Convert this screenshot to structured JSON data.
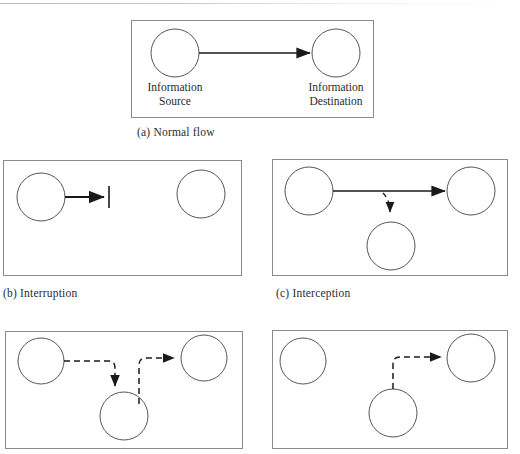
{
  "figure": {
    "stroke_color": "#1a1a1a",
    "box_color": "#8a8a8a",
    "text_color": "#2b2b2b"
  },
  "panels": [
    {
      "id": "a",
      "caption": "(a) Normal flow",
      "labels": {
        "source_line1": "Information",
        "source_line2": "Source",
        "destination_line1": "Information",
        "destination_line2": "Destination"
      },
      "nodes": [
        {
          "name": "information-source",
          "cx": 43,
          "cy": 32,
          "r": 24
        },
        {
          "name": "information-destination",
          "cx": 204,
          "cy": 32,
          "r": 24
        }
      ],
      "flows": [
        {
          "name": "normal-flow-arrow",
          "style": "solid",
          "from": [
            67,
            32
          ],
          "to": [
            178,
            32
          ]
        }
      ]
    },
    {
      "id": "b",
      "caption": "(b) Interruption",
      "nodes": [
        {
          "name": "information-source",
          "cx": 37,
          "cy": 36,
          "r": 24
        },
        {
          "name": "information-destination",
          "cx": 197,
          "cy": 33,
          "r": 24
        }
      ],
      "flows": [
        {
          "name": "interrupted-flow-arrow",
          "style": "solid",
          "from": [
            61,
            36
          ],
          "to": [
            100,
            36
          ]
        }
      ],
      "barrier": {
        "name": "interruption-barrier",
        "x": 105,
        "y1": 25,
        "y2": 47
      }
    },
    {
      "id": "c",
      "caption": "(c) Interception",
      "nodes": [
        {
          "name": "information-source",
          "cx": 36,
          "cy": 31,
          "r": 24
        },
        {
          "name": "information-destination",
          "cx": 198,
          "cy": 31,
          "r": 24
        },
        {
          "name": "attacker-node",
          "cx": 118,
          "cy": 86,
          "r": 24
        }
      ],
      "flows": [
        {
          "name": "normal-flow-arrow",
          "style": "solid",
          "from": [
            60,
            31
          ],
          "to": [
            172,
            31
          ]
        },
        {
          "name": "interception-branch-arrow",
          "style": "dashed",
          "from": [
            112,
            33
          ],
          "to": [
            118,
            60
          ]
        }
      ]
    },
    {
      "id": "d",
      "caption": "",
      "nodes": [
        {
          "name": "information-source",
          "cx": 35,
          "cy": 29,
          "r": 23
        },
        {
          "name": "information-destination",
          "cx": 198,
          "cy": 26,
          "r": 23
        },
        {
          "name": "attacker-node",
          "cx": 118,
          "cy": 84,
          "r": 24
        }
      ],
      "flows": [
        {
          "name": "modification-inbound-arrow",
          "style": "dashed",
          "path": "M 58 29 L 103 29 Q 109 29 109 36 L 109 58"
        },
        {
          "name": "modification-outbound-arrow",
          "style": "dashed",
          "path": "M 133 70 L 133 33 Q 133 26 140 26 L 172 26"
        }
      ]
    },
    {
      "id": "e",
      "caption": "",
      "nodes": [
        {
          "name": "information-source",
          "cx": 30,
          "cy": 30,
          "r": 23
        },
        {
          "name": "information-destination",
          "cx": 198,
          "cy": 27,
          "r": 24
        },
        {
          "name": "attacker-node",
          "cx": 120,
          "cy": 82,
          "r": 24
        }
      ],
      "flows": [
        {
          "name": "fabrication-arrow",
          "style": "dashed",
          "path": "M 113 60 L 113 33 Q 113 26 120 26 L 172 26"
        }
      ]
    }
  ]
}
